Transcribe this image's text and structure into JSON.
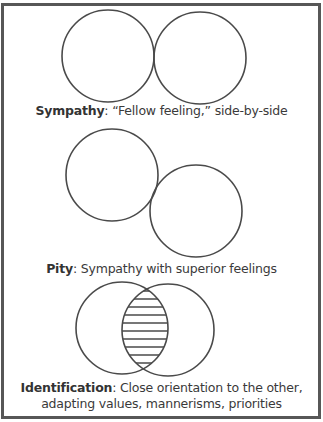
{
  "figure": {
    "panels": [
      {
        "id": "sympathy",
        "term": "Sympathy",
        "separator": ": ",
        "description": "“Fellow feeling,” side-by-side",
        "circles": [
          {
            "cx": 108,
            "cy": 56,
            "r": 46
          },
          {
            "cx": 200,
            "cy": 58,
            "r": 46
          }
        ]
      },
      {
        "id": "pity",
        "term": "Pity",
        "separator": ": ",
        "description": "Sympathy with superior feelings",
        "circles": [
          {
            "cx": 112,
            "cy": 175,
            "r": 46
          },
          {
            "cx": 196,
            "cy": 211,
            "r": 46
          }
        ]
      },
      {
        "id": "identification",
        "term": "Identification",
        "separator": ": ",
        "description": "Close orientation to the other,",
        "description_line2": "adapting values, mannerisms, priorities",
        "circles": [
          {
            "cx": 122,
            "cy": 328,
            "r": 46
          },
          {
            "cx": 168,
            "cy": 330,
            "r": 46
          }
        ],
        "overlap_fill": "horizontal-hatch"
      }
    ],
    "colors": {
      "stroke": "#4a4a4a",
      "border": "#575757",
      "text": "#3a3a3a"
    }
  }
}
